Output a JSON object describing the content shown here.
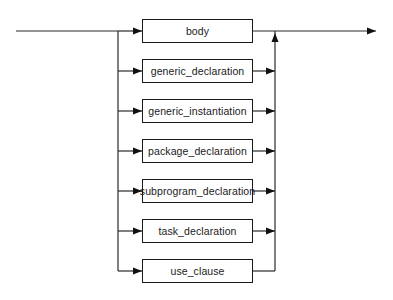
{
  "diagram": {
    "type": "syntax-railroad-diagram",
    "line_color": "#2a2a2a",
    "box_border_color": "#1a1a1a",
    "background": "#ffffff",
    "entry": {
      "x1": 16,
      "x2": 118,
      "y": 31
    },
    "exit": {
      "x1": 252,
      "x2": 376,
      "y": 31
    },
    "left_rail_x": 118,
    "right_rail_x": 275,
    "box": {
      "left": 142,
      "width": 111,
      "height": 24
    },
    "alternatives": [
      {
        "id": "body",
        "label": "body",
        "y": 31
      },
      {
        "id": "generic_declaration",
        "label": "generic_declaration",
        "y": 71
      },
      {
        "id": "generic_instantiation",
        "label": "generic_instantiation",
        "y": 111
      },
      {
        "id": "package_declaration",
        "label": "package_declaration",
        "y": 151
      },
      {
        "id": "subprogram_declaration",
        "label": "subprogram_declaration",
        "y": 191
      },
      {
        "id": "task_declaration",
        "label": "task_declaration",
        "y": 231
      },
      {
        "id": "use_clause",
        "label": "use_clause",
        "y": 271
      }
    ]
  }
}
